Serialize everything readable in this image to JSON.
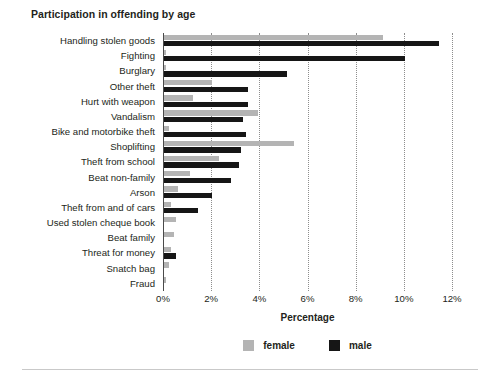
{
  "chart_data": {
    "type": "bar",
    "orientation": "horizontal",
    "title": "Participation in offending by age",
    "xlabel": "Percentage",
    "ylabel": "",
    "xlim": [
      0,
      12
    ],
    "xticks": [
      "0%",
      "2%",
      "4%",
      "6%",
      "8%",
      "10%",
      "12%"
    ],
    "xtick_values": [
      0,
      2,
      4,
      6,
      8,
      10,
      12
    ],
    "grid": "vertical-dotted",
    "legend_position": "bottom-center",
    "categories": [
      "Handling stolen goods",
      "Fighting",
      "Burglary",
      "Other theft",
      "Hurt with weapon",
      "Vandalism",
      "Bike and motorbike theft",
      "Shoplifting",
      "Theft from school",
      "Beat non-family",
      "Arson",
      "Theft from and of cars",
      "Used stolen cheque book",
      "Beat family",
      "Threat for money",
      "Snatch bag",
      "Fraud"
    ],
    "series": [
      {
        "name": "female",
        "color": "#b4b4b4",
        "values": [
          9.1,
          0.1,
          0.1,
          2.0,
          1.2,
          3.9,
          0.2,
          5.4,
          2.3,
          1.1,
          0.6,
          0.3,
          0.5,
          0.4,
          0.3,
          0.2,
          0.1
        ]
      },
      {
        "name": "male",
        "color": "#161616",
        "values": [
          11.4,
          10.0,
          5.1,
          3.5,
          3.5,
          3.3,
          3.4,
          3.2,
          3.1,
          2.8,
          2.0,
          1.4,
          0.0,
          0.0,
          0.5,
          0.0,
          0.0
        ]
      }
    ]
  },
  "legend": {
    "entries": [
      {
        "label": "female",
        "color": "#b4b4b4"
      },
      {
        "label": "male",
        "color": "#161616"
      }
    ]
  }
}
